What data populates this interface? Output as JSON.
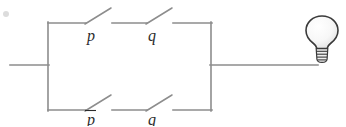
{
  "figure": {
    "background_color": "#ffffff",
    "wire_color": "#8d8d8d",
    "label_color": "#2b2b2b",
    "bulb_color": "#3a3a3a",
    "width": 346,
    "height": 126
  },
  "labels": {
    "top_left_switch": "p",
    "top_right_switch": "q",
    "bottom_left_switch": "p",
    "bottom_left_switch_negated": true,
    "bottom_right_switch": "q"
  },
  "components": {
    "lamp_name": "light-bulb",
    "input_wire_name": "input-wire",
    "output_wire_name": "output-wire",
    "top_branch_name": "top-branch",
    "bottom_branch_name": "bottom-branch"
  },
  "geometry": {
    "left_bus_x": 48,
    "right_bus_x": 211,
    "top_rail_y": 23,
    "bottom_rail_y": 110,
    "mid_y": 65,
    "input_wire_x1": 10,
    "output_wire_x2": 318,
    "bulb_cx": 322,
    "bulb_cy": 32
  }
}
